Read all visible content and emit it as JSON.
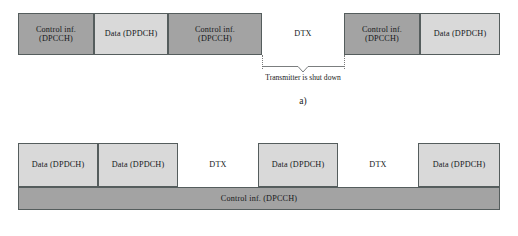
{
  "figure": {
    "colors": {
      "control_fill": "#a3a3a3",
      "data_fill": "#d9d9d9",
      "dtx_fill": "#ffffff",
      "outline": "#555d5d",
      "text": "#15181a"
    }
  },
  "panel_a": {
    "label": "a)",
    "annotation": "Transmitter is shut down",
    "blocks": [
      {
        "kind": "control",
        "line1": "Control inf.",
        "line2": "(DPCCH)",
        "x": 18,
        "width": 76
      },
      {
        "kind": "data",
        "line1": "Data (DPDCH)",
        "line2": "",
        "x": 94,
        "width": 74
      },
      {
        "kind": "control",
        "line1": "Control inf.",
        "line2": "(DPCCH)",
        "x": 168,
        "width": 94
      },
      {
        "kind": "dtx",
        "line1": "DTX",
        "line2": "",
        "x": 262,
        "width": 82
      },
      {
        "kind": "control",
        "line1": "Control inf.",
        "line2": "(DPCCH)",
        "x": 344,
        "width": 76
      },
      {
        "kind": "data",
        "line1": "Data (DPDCH)",
        "line2": "",
        "x": 420,
        "width": 80
      }
    ],
    "gap": {
      "x": 262,
      "width": 82
    }
  },
  "panel_b": {
    "blocks": [
      {
        "kind": "data",
        "line1": "Data (DPDCH)",
        "x": 18,
        "width": 80
      },
      {
        "kind": "data",
        "line1": "Data (DPDCH)",
        "x": 98,
        "width": 80
      },
      {
        "kind": "dtx",
        "line1": "DTX",
        "x": 178,
        "width": 80
      },
      {
        "kind": "data",
        "line1": "Data (DPDCH)",
        "x": 258,
        "width": 80
      },
      {
        "kind": "dtx",
        "line1": "DTX",
        "x": 338,
        "width": 80
      },
      {
        "kind": "data",
        "line1": "Data (DPDCH)",
        "x": 418,
        "width": 82
      }
    ],
    "control_bar": {
      "label": "Control inf. (DPCCH)"
    }
  }
}
